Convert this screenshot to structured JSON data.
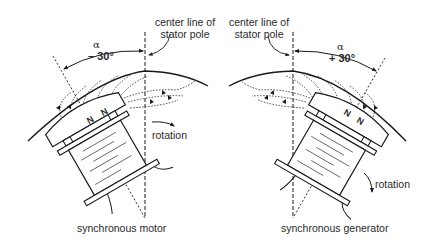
{
  "motor": {
    "center_line_label_1": "center line of",
    "center_line_label_2": "stator pole",
    "alpha_symbol": "α",
    "angle": "– 30°",
    "pole_left": "N",
    "pole_right": "N",
    "rotation_label": "rotation",
    "caption": "synchronous motor"
  },
  "generator": {
    "center_line_label_1": "center line of",
    "center_line_label_2": "stator pole",
    "alpha_symbol": "α",
    "angle": "+ 30°",
    "pole_left": "N",
    "pole_right": "N",
    "rotation_label": "rotation",
    "caption": "synchronous generator"
  },
  "colors": {
    "line": "#1a1a1a",
    "text": "#2a2a2a",
    "background": "#ffffff"
  }
}
